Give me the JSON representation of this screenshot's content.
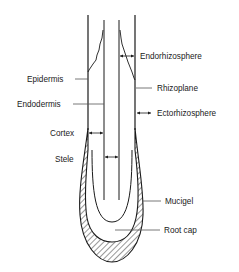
{
  "diagram": {
    "stroke_color": "#1a1a1a",
    "labels_left": [
      {
        "id": "epidermis",
        "text": "Epidermis"
      },
      {
        "id": "endodermis",
        "text": "Endodermis"
      },
      {
        "id": "cortex",
        "text": "Cortex"
      },
      {
        "id": "stele",
        "text": "Stele"
      }
    ],
    "labels_right": [
      {
        "id": "endorhizosphere",
        "text": "Endorhizosphere"
      },
      {
        "id": "rhizoplane",
        "text": "Rhizoplane"
      },
      {
        "id": "ectorhizosphere",
        "text": "Ectorhizosphere"
      },
      {
        "id": "mucigel",
        "text": "Mucigel"
      },
      {
        "id": "root-cap",
        "text": "Root cap"
      }
    ]
  }
}
